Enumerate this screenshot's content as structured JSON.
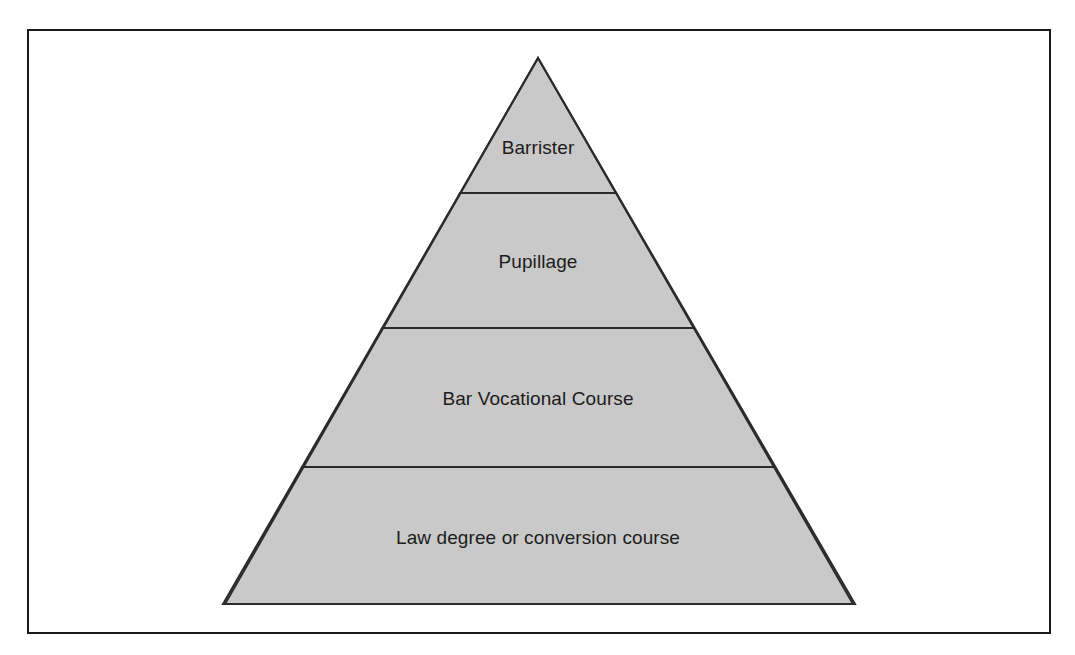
{
  "figure": {
    "type": "pyramid-diagram",
    "background_color": "#ffffff",
    "frame": {
      "border_color": "#1a1a1a",
      "border_width": 2,
      "x": 27,
      "y": 29,
      "width": 1024,
      "height": 605
    }
  },
  "pyramid": {
    "fill_color": "#c9c9c9",
    "stroke_color": "#2b2b2b",
    "stroke_width": 2,
    "apex": {
      "x": 538,
      "y": 58
    },
    "base_left": {
      "x": 225,
      "y": 604
    },
    "base_right": {
      "x": 855,
      "y": 604
    },
    "divider_y": [
      193,
      328,
      467
    ],
    "tiers": [
      {
        "index": 0,
        "label": "Barrister",
        "label_x": 538,
        "label_y": 148,
        "top_y": 58,
        "bottom_y": 193
      },
      {
        "index": 1,
        "label": "Pupillage",
        "label_x": 538,
        "label_y": 262,
        "top_y": 193,
        "bottom_y": 328
      },
      {
        "index": 2,
        "label": "Bar Vocational Course",
        "label_x": 538,
        "label_y": 399,
        "top_y": 328,
        "bottom_y": 467
      },
      {
        "index": 3,
        "label": "Law degree or conversion course",
        "label_x": 538,
        "label_y": 538,
        "top_y": 467,
        "bottom_y": 604
      }
    ]
  },
  "chart_data": {
    "type": "pyramid",
    "title": "",
    "categories": [
      "Barrister",
      "Pupillage",
      "Bar Vocational Course",
      "Law degree or conversion course"
    ],
    "values": [
      135,
      135,
      139,
      137
    ],
    "value_unit": "tier height (px)",
    "order": "top-to-bottom",
    "xlabel": "",
    "ylabel": "",
    "legend": "none",
    "grid": false
  }
}
